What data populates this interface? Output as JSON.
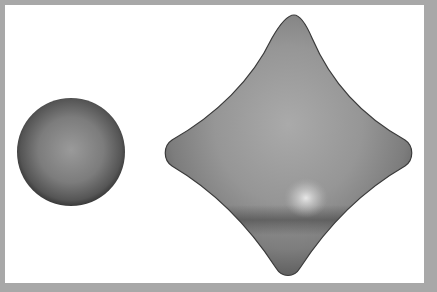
{
  "figure": {
    "objects": [
      {
        "name": "sphere",
        "color": "#7a7a7a"
      },
      {
        "name": "astroid-surface",
        "color": "#8c8c8c"
      }
    ],
    "colors": {
      "border": "#a8a8a8",
      "background": "#ffffff"
    }
  }
}
